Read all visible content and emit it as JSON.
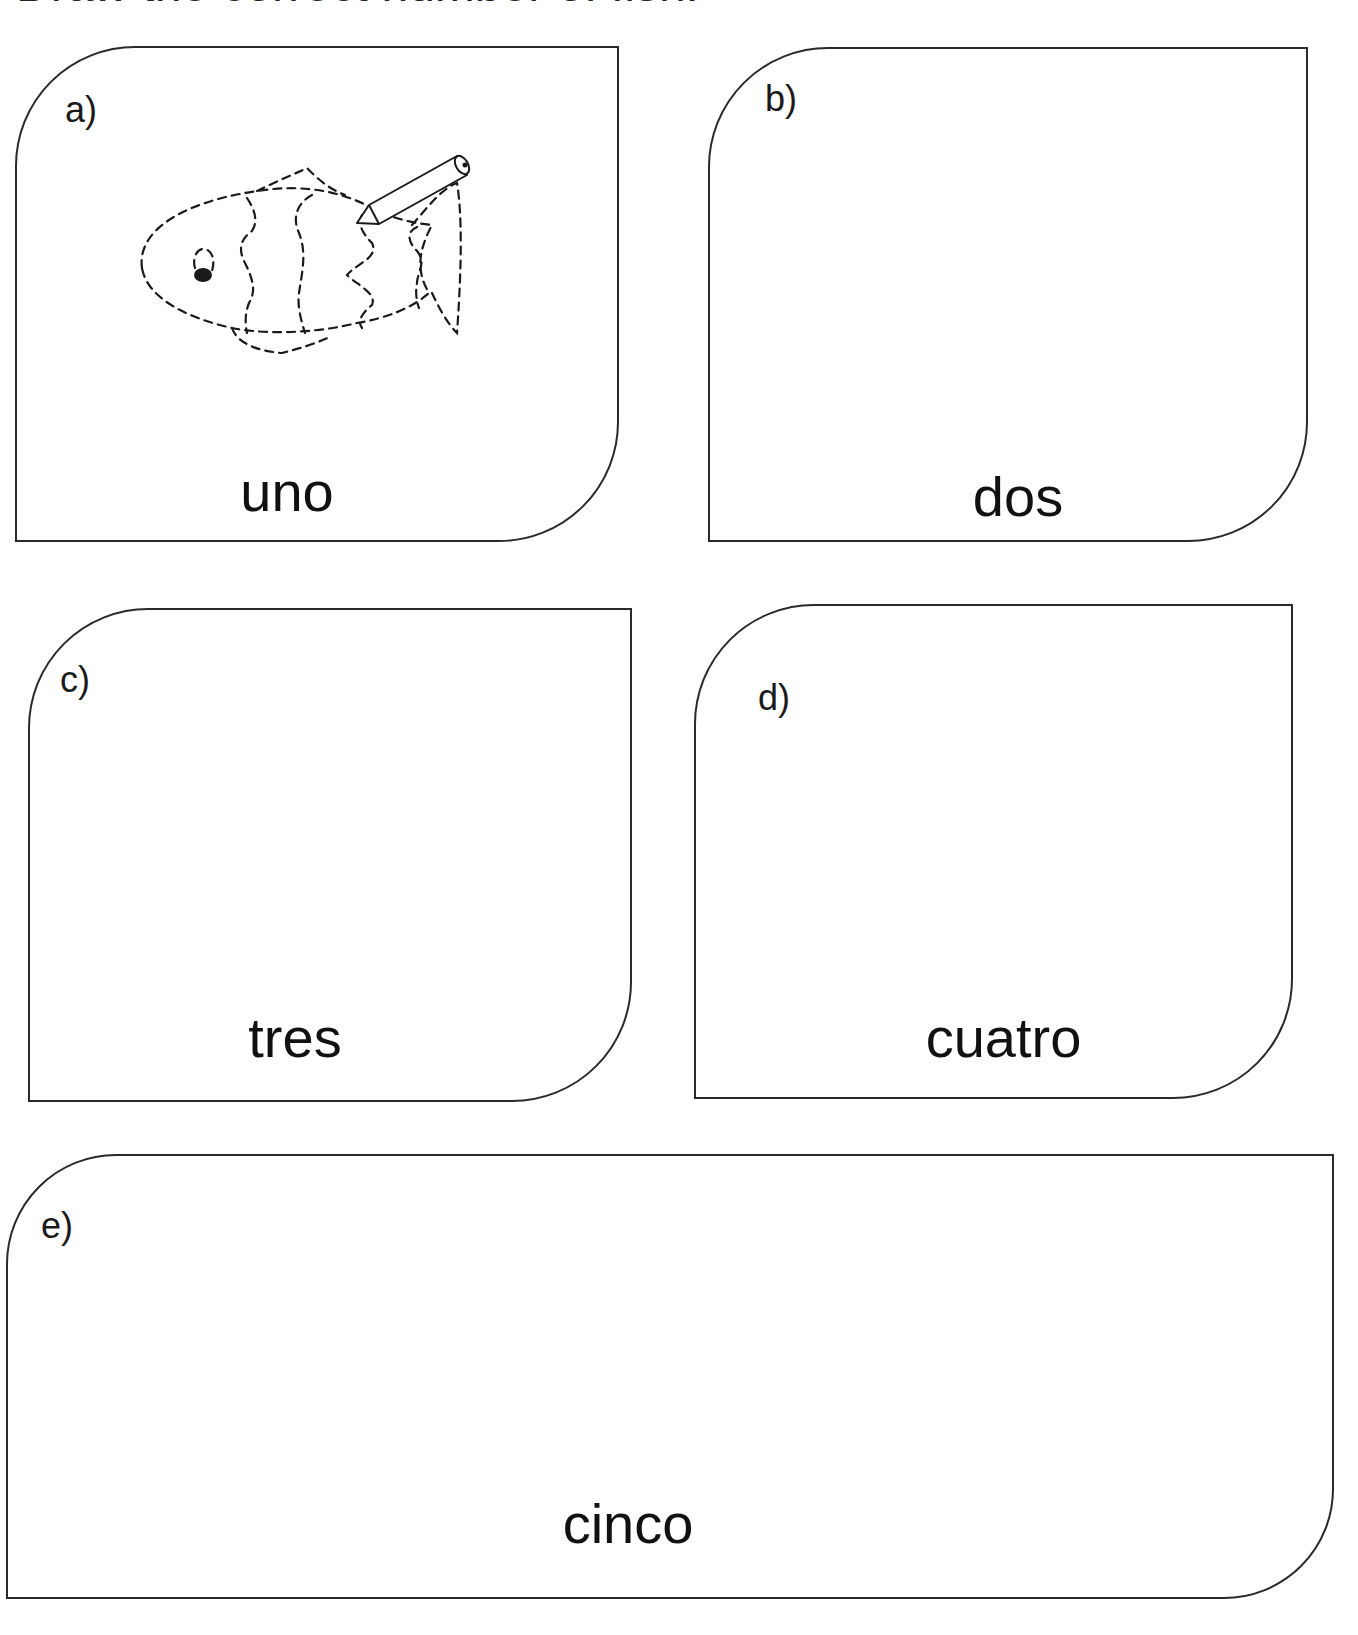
{
  "worksheet": {
    "title": "Draw the correct number of fish."
  },
  "cards": [
    {
      "id": "a",
      "letter": "a)",
      "word": "uno",
      "number": 1,
      "example_drawing": "fish-tracing-with-pencil"
    },
    {
      "id": "b",
      "letter": "b)",
      "word": "dos",
      "number": 2
    },
    {
      "id": "c",
      "letter": "c)",
      "word": "tres",
      "number": 3
    },
    {
      "id": "d",
      "letter": "d)",
      "word": "cuatro",
      "number": 4
    },
    {
      "id": "e",
      "letter": "e)",
      "word": "cinco",
      "number": 5
    }
  ],
  "colors": {
    "ink": "#1a1a1a",
    "background": "#ffffff"
  }
}
